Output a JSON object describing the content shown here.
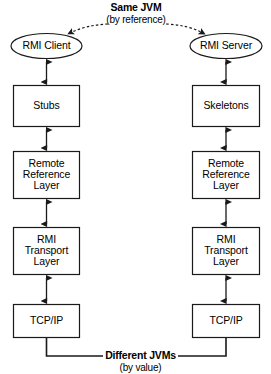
{
  "diagram": {
    "annotations": {
      "top": {
        "title": "Same JVM",
        "subtitle": "(by reference)"
      },
      "bottom": {
        "title": "Different JVMs",
        "subtitle": "(by value)"
      }
    },
    "columns": [
      {
        "id": "client",
        "endpoint": "RMI Client",
        "nodes": [
          {
            "id": "stubs",
            "label": "Stubs"
          },
          {
            "id": "remote-reference-layer",
            "label": "Remote\nReference\nLayer"
          },
          {
            "id": "rmi-transport-layer",
            "label": "RMI\nTransport\nLayer"
          },
          {
            "id": "tcp-ip",
            "label": "TCP/IP"
          }
        ]
      },
      {
        "id": "server",
        "endpoint": "RMI Server",
        "nodes": [
          {
            "id": "skeletons",
            "label": "Skeletons"
          },
          {
            "id": "remote-reference-layer",
            "label": "Remote\nReference\nLayer"
          },
          {
            "id": "rmi-transport-layer",
            "label": "RMI\nTransport\nLayer"
          },
          {
            "id": "tcp-ip",
            "label": "TCP/IP"
          }
        ]
      }
    ],
    "colors": {
      "stroke": "#1a1a1a",
      "fill": "#ffffff",
      "text": "#000000"
    }
  }
}
